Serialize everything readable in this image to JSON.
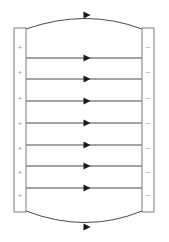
{
  "diagram": {
    "background_color": "#ffffff",
    "width": 169,
    "height": 242
  },
  "plates": {
    "left": {
      "name": "positive-plate",
      "charge_symbol": "+",
      "charge_count": 7,
      "charge_color": "#9a9a9a",
      "outline_color": "#7d7d7d",
      "x": 14,
      "y": 28,
      "width": 12,
      "height": 184
    },
    "right": {
      "name": "negative-plate",
      "charge_symbol": "–",
      "charge_count": 7,
      "charge_color": "#b0b0b0",
      "outline_color": "#7d7d7d",
      "x": 142,
      "y": 28,
      "width": 12,
      "height": 184
    }
  },
  "field": {
    "line_color": "#4a4a4a",
    "arrow_color": "#1a1a1a",
    "direction": "left-to-right",
    "straight_line_count": 7,
    "fringe_line_count": 2,
    "straight_lines": [
      {
        "y": 58,
        "x_start": 26,
        "x_end": 142,
        "arrow_x": 87
      },
      {
        "y": 79,
        "x_start": 26,
        "x_end": 142,
        "arrow_x": 87
      },
      {
        "y": 101,
        "x_start": 26,
        "x_end": 142,
        "arrow_x": 87
      },
      {
        "y": 123,
        "x_start": 26,
        "x_end": 142,
        "arrow_x": 87
      },
      {
        "y": 145,
        "x_start": 26,
        "x_end": 142,
        "arrow_x": 87
      },
      {
        "y": 166,
        "x_start": 26,
        "x_end": 142,
        "arrow_x": 87
      },
      {
        "y": 188,
        "x_start": 26,
        "x_end": 142,
        "arrow_x": 87
      }
    ],
    "fringe_lines": [
      {
        "name": "top-fringe-line",
        "path": "M 26 29 Q 86 8 142 29",
        "arrow_x": 87,
        "arrow_y": 15,
        "arrow_rotation": -2
      },
      {
        "name": "bottom-fringe-line",
        "path": "M 26 211 Q 86 234 142 211",
        "arrow_x": 87,
        "arrow_y": 227,
        "arrow_rotation": 2
      }
    ]
  },
  "charges": {
    "left_positions": [
      47,
      72,
      98,
      123,
      148,
      172,
      195
    ],
    "right_positions": [
      47,
      72,
      98,
      123,
      148,
      172,
      195
    ]
  }
}
